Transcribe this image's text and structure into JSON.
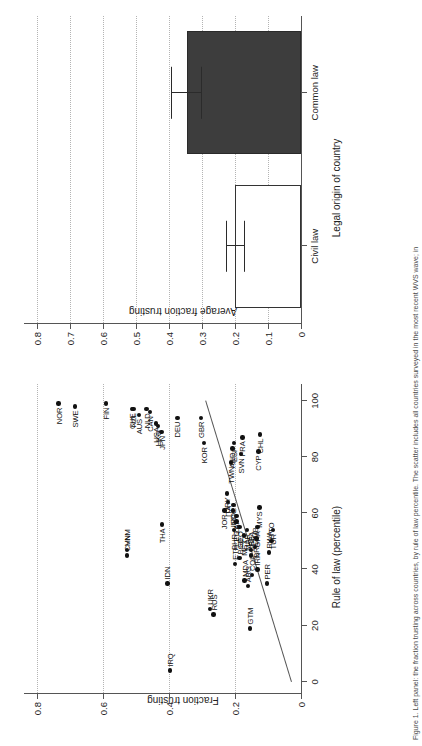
{
  "figure": {
    "caption": "Figure 1. Left panel: the fraction trusting across countries, by rule of law percentile. The scatter includes all countries surveyed in the most recent WVS wave; in"
  },
  "scatter": {
    "panel_name": "scatter-panel",
    "ylabel": "Fraction trusting",
    "xlabel": "Rule of law (percentile)",
    "yticks": [
      "0",
      "0.2",
      "0.4",
      "0.6",
      "0.8"
    ],
    "ytick_values": [
      0,
      0.2,
      0.4,
      0.6,
      0.8
    ],
    "xticks": [
      "0",
      "20",
      "40",
      "60",
      "80",
      "100"
    ],
    "xtick_values": [
      0,
      20,
      40,
      60,
      80,
      100
    ],
    "xlim": [
      -4,
      106
    ],
    "ylim": [
      0,
      0.84
    ],
    "fit_line": {
      "x0": 0,
      "y0": 0.03,
      "x1": 100,
      "y1": 0.29
    }
  },
  "bar": {
    "panel_name": "bar-panel",
    "ylabel": "Average fraction trusting",
    "xlabel": "Legal origin of country",
    "yticks": [
      "0",
      "0.1",
      "0.2",
      "0.3",
      "0.4",
      "0.5",
      "0.6",
      "0.7",
      "0.8"
    ],
    "ytick_values": [
      0,
      0.1,
      0.2,
      0.3,
      0.4,
      0.5,
      0.6,
      0.7,
      0.8
    ],
    "ylim": [
      0,
      0.84
    ],
    "categories": [
      "Civil law",
      "Common law"
    ]
  },
  "chart_data": [
    {
      "type": "scatter",
      "title": "",
      "xlabel": "Rule of law (percentile)",
      "ylabel": "Fraction trusting",
      "xlim": [
        0,
        100
      ],
      "ylim": [
        0,
        0.8
      ],
      "grid": "horizontal-dotted",
      "legend": "none",
      "annotations": [
        "country ISO3 codes label each point"
      ],
      "fit_line": {
        "intercept": 0.03,
        "slope": 0.0026
      },
      "points": [
        {
          "label": "NOR",
          "x": 99,
          "y": 0.735
        },
        {
          "label": "SWE",
          "x": 98,
          "y": 0.685
        },
        {
          "label": "FIN",
          "x": 99,
          "y": 0.592
        },
        {
          "label": "CHE",
          "x": 97,
          "y": 0.513
        },
        {
          "label": "NZL",
          "x": 97,
          "y": 0.508
        },
        {
          "label": "AUS",
          "x": 95,
          "y": 0.492
        },
        {
          "label": "NLD",
          "x": 97,
          "y": 0.468
        },
        {
          "label": "CAN",
          "x": 96,
          "y": 0.458
        },
        {
          "label": "USA",
          "x": 92,
          "y": 0.44
        },
        {
          "label": "HKG",
          "x": 91,
          "y": 0.434
        },
        {
          "label": "JPN",
          "x": 89,
          "y": 0.423
        },
        {
          "label": "DEU",
          "x": 94,
          "y": 0.375
        },
        {
          "label": "GBR",
          "x": 94,
          "y": 0.303
        },
        {
          "label": "KOR",
          "x": 85,
          "y": 0.295
        },
        {
          "label": "CHN",
          "x": 45,
          "y": 0.528
        },
        {
          "label": "VNM",
          "x": 47,
          "y": 0.527
        },
        {
          "label": "THA",
          "x": 56,
          "y": 0.422
        },
        {
          "label": "IDN",
          "x": 35,
          "y": 0.405
        },
        {
          "label": "IRQ",
          "x": 4,
          "y": 0.398
        },
        {
          "label": "JOR",
          "x": 61,
          "y": 0.232
        },
        {
          "label": "ITA",
          "x": 64,
          "y": 0.221
        },
        {
          "label": "URY",
          "x": 67,
          "y": 0.225
        },
        {
          "label": "TWN",
          "x": 78,
          "y": 0.212
        },
        {
          "label": "AND",
          "x": 83,
          "y": 0.208
        },
        {
          "label": "ESP",
          "x": 85,
          "y": 0.203
        },
        {
          "label": "SVN",
          "x": 81,
          "y": 0.182
        },
        {
          "label": "FRA",
          "x": 87,
          "y": 0.178
        },
        {
          "label": "CYP",
          "x": 82,
          "y": 0.129
        },
        {
          "label": "CHL",
          "x": 88,
          "y": 0.124
        },
        {
          "label": "IND",
          "x": 61,
          "y": 0.206
        },
        {
          "label": "POL",
          "x": 63,
          "y": 0.205
        },
        {
          "label": "ZAF",
          "x": 59,
          "y": 0.196
        },
        {
          "label": "BHR",
          "x": 54,
          "y": 0.203
        },
        {
          "label": "EGY",
          "x": 57,
          "y": 0.196
        },
        {
          "label": "GEO",
          "x": 55,
          "y": 0.186
        },
        {
          "label": "MEX",
          "x": 52,
          "y": 0.173
        },
        {
          "label": "MAR",
          "x": 54,
          "y": 0.164
        },
        {
          "label": "ETH",
          "x": 42,
          "y": 0.2
        },
        {
          "label": "BGD",
          "x": 44,
          "y": 0.186
        },
        {
          "label": "SRB",
          "x": 45,
          "y": 0.151
        },
        {
          "label": "BFA",
          "x": 47,
          "y": 0.152
        },
        {
          "label": "ZMB",
          "x": 48,
          "y": 0.14
        },
        {
          "label": "BRA",
          "x": 51,
          "y": 0.135
        },
        {
          "label": "GHA",
          "x": 55,
          "y": 0.132
        },
        {
          "label": "MYS",
          "x": 62,
          "y": 0.126
        },
        {
          "label": "UKR",
          "x": 26,
          "y": 0.276
        },
        {
          "label": "RUS",
          "x": 24,
          "y": 0.265
        },
        {
          "label": "MDA",
          "x": 36,
          "y": 0.171
        },
        {
          "label": "ARG",
          "x": 34,
          "y": 0.16
        },
        {
          "label": "COL",
          "x": 38,
          "y": 0.149
        },
        {
          "label": "GTM",
          "x": 19,
          "y": 0.155
        },
        {
          "label": "IRN",
          "x": 40,
          "y": 0.132
        },
        {
          "label": "PER",
          "x": 35,
          "y": 0.104
        },
        {
          "label": "RWA",
          "x": 46,
          "y": 0.097
        },
        {
          "label": "TTO",
          "x": 50,
          "y": 0.09
        },
        {
          "label": "TUR",
          "x": 54,
          "y": 0.085
        }
      ]
    },
    {
      "type": "bar",
      "title": "",
      "xlabel": "Legal origin of country",
      "ylabel": "Average fraction trusting",
      "categories": [
        "Civil law",
        "Common law"
      ],
      "values": [
        0.199,
        0.345
      ],
      "error_low": [
        0.172,
        0.303
      ],
      "error_high": [
        0.228,
        0.395
      ],
      "ylim": [
        0,
        0.8
      ],
      "grid": "horizontal-dotted",
      "legend": "none",
      "colors": [
        "#ffffff",
        "#3d3d3d"
      ]
    }
  ]
}
